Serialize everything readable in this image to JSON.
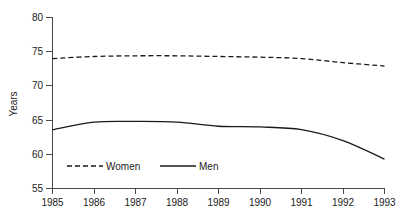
{
  "figure": {
    "title_remnant": "",
    "y_axis_label": "Years",
    "x_axis_label": ""
  },
  "legend": {
    "position": "inside-bottom-left",
    "entries": [
      {
        "label": "Women",
        "style": "dashed",
        "color": "#1a1a1a"
      },
      {
        "label": "Men",
        "style": "solid",
        "color": "#1a1a1a"
      }
    ]
  },
  "axes": {
    "y_ticks": [
      "80",
      "75",
      "70",
      "65",
      "60",
      "55"
    ],
    "x_ticks": [
      "1985",
      "1986",
      "1987",
      "1988",
      "1989",
      "1990",
      "1991",
      "1992",
      "1993"
    ]
  },
  "chart_data": {
    "type": "line",
    "title": "",
    "xlabel": "",
    "ylabel": "Years",
    "x": [
      1985,
      1986,
      1987,
      1988,
      1989,
      1990,
      1991,
      1992,
      1993
    ],
    "categories": [
      "1985",
      "1986",
      "1987",
      "1988",
      "1989",
      "1990",
      "1991",
      "1992",
      "1993"
    ],
    "series": [
      {
        "name": "Women",
        "style": "dashed",
        "color": "#1a1a1a",
        "values": [
          74.0,
          74.3,
          74.4,
          74.4,
          74.3,
          74.2,
          74.0,
          73.4,
          72.9
        ]
      },
      {
        "name": "Men",
        "style": "solid",
        "color": "#1a1a1a",
        "values": [
          63.6,
          64.7,
          64.8,
          64.7,
          64.1,
          64.0,
          63.6,
          62.0,
          59.3
        ]
      }
    ],
    "xlim": [
      1985,
      1993
    ],
    "ylim": [
      55,
      80
    ],
    "y_tick_values": [
      80,
      75,
      70,
      65,
      60,
      55
    ],
    "grid": false,
    "legend_position": "inside-bottom-left"
  }
}
